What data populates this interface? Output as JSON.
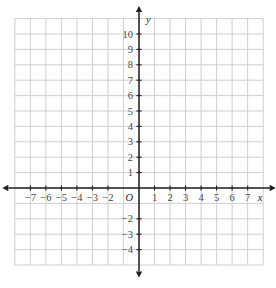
{
  "figure": {
    "kind": "cartesian-coordinate-grid",
    "origin_label": "O",
    "x_axis_name": "x",
    "y_axis_name": "y",
    "grid_color": "#c9c9cf",
    "axis_color": "#231f20",
    "label_color": "#4a4a4a",
    "background": "#ffffff"
  },
  "chart_data": {
    "type": "scatter",
    "title": "",
    "subtitle": "",
    "xlabel": "x",
    "ylabel": "y",
    "series": [
      {
        "name": "",
        "x": [],
        "y": []
      }
    ],
    "xlim": [
      -8,
      8
    ],
    "ylim": [
      -5,
      11
    ],
    "xticks": [
      -7,
      -6,
      -5,
      -4,
      -3,
      -2,
      1,
      2,
      3,
      4,
      5,
      6,
      7
    ],
    "yticks": [
      10,
      9,
      8,
      7,
      6,
      5,
      4,
      3,
      2,
      1,
      -2,
      -3,
      -4
    ],
    "xtick_labels": [
      "−7",
      "−6",
      "−5",
      "−4",
      "−3",
      "−2",
      "1",
      "2",
      "3",
      "4",
      "5",
      "6",
      "7"
    ],
    "ytick_labels": [
      "10",
      "9",
      "8",
      "7",
      "6",
      "5",
      "4",
      "3",
      "2",
      "1",
      "−2",
      "−3",
      "−4"
    ],
    "grid": true,
    "grid_step": 1,
    "legend": null,
    "annotations": [
      {
        "text": "O",
        "x": 0,
        "y": 0,
        "role": "origin-label"
      },
      {
        "text": "x",
        "x": 7.8,
        "y": -0.55,
        "role": "x-axis-name"
      },
      {
        "text": "y",
        "x": 0.6,
        "y": 10.7,
        "role": "y-axis-name"
      }
    ],
    "arrows": [
      "x-negative",
      "x-positive",
      "y-negative",
      "y-positive"
    ]
  },
  "x_tick_labels": [
    {
      "value": -7,
      "text": "−7"
    },
    {
      "value": -6,
      "text": "−6"
    },
    {
      "value": -5,
      "text": "−5"
    },
    {
      "value": -4,
      "text": "−4"
    },
    {
      "value": -3,
      "text": "−3"
    },
    {
      "value": -2,
      "text": "−2"
    },
    {
      "value": 1,
      "text": "1"
    },
    {
      "value": 2,
      "text": "2"
    },
    {
      "value": 3,
      "text": "3"
    },
    {
      "value": 4,
      "text": "4"
    },
    {
      "value": 5,
      "text": "5"
    },
    {
      "value": 6,
      "text": "6"
    },
    {
      "value": 7,
      "text": "7"
    }
  ],
  "y_tick_labels": [
    {
      "value": 10,
      "text": "10"
    },
    {
      "value": 9,
      "text": "9"
    },
    {
      "value": 8,
      "text": "8"
    },
    {
      "value": 7,
      "text": "7"
    },
    {
      "value": 6,
      "text": "6"
    },
    {
      "value": 5,
      "text": "5"
    },
    {
      "value": 4,
      "text": "4"
    },
    {
      "value": 3,
      "text": "3"
    },
    {
      "value": 2,
      "text": "2"
    },
    {
      "value": 1,
      "text": "1"
    },
    {
      "value": -2,
      "text": "−2"
    },
    {
      "value": -3,
      "text": "−3"
    },
    {
      "value": -4,
      "text": "−4"
    }
  ]
}
